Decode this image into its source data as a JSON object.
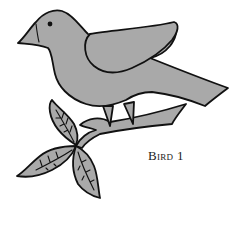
{
  "illustration": {
    "subject": "bird perched on leafy branch",
    "fill_color": "#a9a9a9",
    "stroke_color": "#111111",
    "background": "#ffffff"
  },
  "caption": {
    "text": "Bird 1"
  }
}
